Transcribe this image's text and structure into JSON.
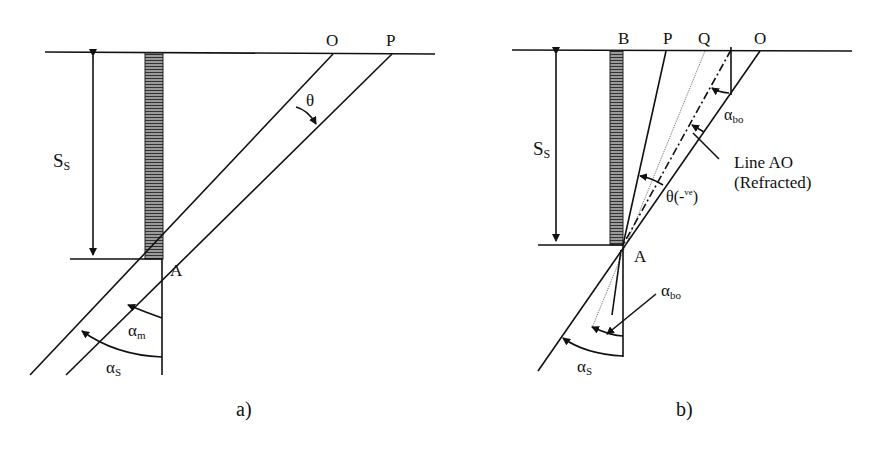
{
  "figure": {
    "panels": [
      {
        "id": "a",
        "caption": "a)",
        "labels": {
          "O": "O",
          "P": "P",
          "A": "A",
          "theta": "θ",
          "Ss_main": "S",
          "Ss_sub": "S",
          "alpha_m_main": "α",
          "alpha_m_sub": "m",
          "alpha_s_main": "α",
          "alpha_s_sub": "S"
        }
      },
      {
        "id": "b",
        "caption": "b)",
        "labels": {
          "B": "B",
          "P": "P",
          "Q": "Q",
          "O": "O",
          "A": "A",
          "Ss_main": "S",
          "Ss_sub": "S",
          "alpha_bo_top_main": "α",
          "alpha_bo_top_sub": "bo",
          "alpha_bo_bottom_main": "α",
          "alpha_bo_bottom_sub": "bo",
          "theta_main": "θ(-",
          "theta_sup": "ve",
          "theta_close": ")",
          "line_ao_1": "Line AO",
          "line_ao_2": "(Refracted)",
          "alpha_s_main": "α",
          "alpha_s_sub": "S"
        }
      }
    ]
  }
}
